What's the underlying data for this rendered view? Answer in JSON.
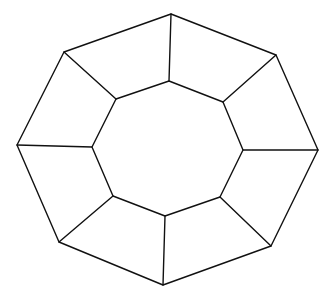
{
  "diagram": {
    "title": "",
    "type": "octagonal-frustum-wireframe",
    "stroke_color": "#111111",
    "background_color": "#ffffff",
    "outer_octagon": [
      [
        171,
        14
      ],
      [
        276,
        55
      ],
      [
        318,
        150
      ],
      [
        271,
        246
      ],
      [
        163,
        285
      ],
      [
        59,
        242
      ],
      [
        17,
        145
      ],
      [
        64,
        52
      ]
    ],
    "inner_octagon": [
      [
        169,
        81
      ],
      [
        223,
        102
      ],
      [
        243,
        150
      ],
      [
        220,
        197
      ],
      [
        165,
        216
      ],
      [
        113,
        196
      ],
      [
        92,
        147
      ],
      [
        116,
        99
      ]
    ],
    "spokes": "connect outer_octagon[i] to inner_octagon[i] for i in 0..7",
    "labels": []
  }
}
